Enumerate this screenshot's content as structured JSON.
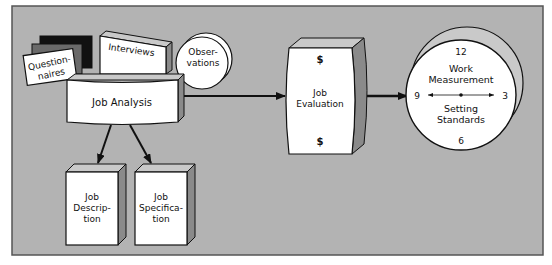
{
  "diagram": {
    "colors": {
      "background": "#ffffff",
      "panel": "#b3b3b3",
      "panel_border": "#555555",
      "box_face": "#ffffff",
      "box_top": "#c9c9c9",
      "box_side": "#8a8a8a",
      "dark_card": "#111111",
      "mid_card": "#6a6a6a",
      "outline": "#111111"
    },
    "sources": {
      "questionnaires": {
        "line1": "Question-",
        "line2": "naires"
      },
      "interviews": {
        "label": "Interviews"
      },
      "observations": {
        "line1": "Obser-",
        "line2": "vations"
      }
    },
    "job_analysis": {
      "label": "Job Analysis"
    },
    "outputs": [
      {
        "id": "job-description",
        "line1": "Job",
        "line2": "Descrip-",
        "line3": "tion"
      },
      {
        "id": "job-specification",
        "line1": "Job",
        "line2": "Specifica-",
        "line3": "tion"
      }
    ],
    "job_evaluation": {
      "line1": "Job",
      "line2": "Evaluation",
      "symbol_top": "$",
      "symbol_bottom": "$"
    },
    "work_measurement": {
      "line1": "Work",
      "line2": "Measurement",
      "line3": "Setting",
      "line4": "Standards",
      "clock": {
        "twelve": "12",
        "three": "3",
        "six": "6",
        "nine": "9"
      }
    }
  }
}
